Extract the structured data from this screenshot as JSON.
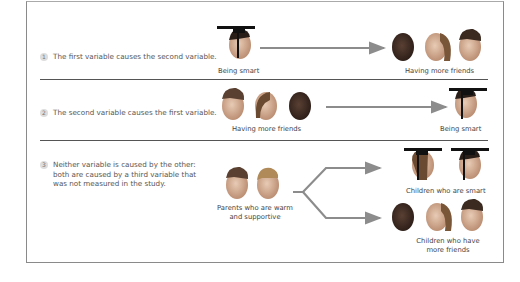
{
  "steps": [
    {
      "number": "1",
      "text": "The first variable causes the second variable.",
      "cause_label": "Being smart",
      "effect_label": "Having more friends"
    },
    {
      "number": "2",
      "text": "The second variable causes the first variable.",
      "cause_label": "Having more friends",
      "effect_label": "Being smart"
    },
    {
      "number": "3",
      "text_lines": [
        "Neither variable is caused by the other:",
        "both are caused by a third variable that",
        "was not measured in the study."
      ],
      "cause_label_lines": [
        "Parents who are warm",
        "and supportive"
      ],
      "effect1_label": "Children who are smart",
      "effect2_label_lines": [
        "Children who have",
        "more friends"
      ]
    }
  ],
  "colors": {
    "arrow": "#8c8c8c",
    "frame": "#8a8a8a",
    "divider": "#555555",
    "text": "#444444"
  }
}
